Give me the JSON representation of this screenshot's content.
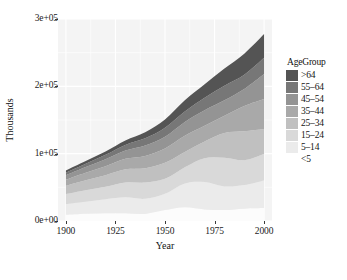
{
  "chart_data": {
    "type": "area",
    "stacked": true,
    "title": "",
    "xlabel": "Year",
    "ylabel": "Thousands",
    "xlim": [
      1896,
      2004
    ],
    "ylim": [
      0,
      300000
    ],
    "xticks": [
      1900,
      1925,
      1950,
      1975,
      2000
    ],
    "xtick_labels": [
      "1900",
      "1925",
      "1950",
      "1975",
      "2000"
    ],
    "yticks": [
      0,
      100000,
      200000,
      300000
    ],
    "ytick_labels": [
      "0e+00",
      "1e+05",
      "2e+05",
      "3e+05"
    ],
    "grid": true,
    "legend_title": "AgeGroup",
    "legend_position": "right",
    "panel_background": "#f4f4f4",
    "gridline_color": "#ffffff",
    "x": [
      1900,
      1910,
      1920,
      1930,
      1940,
      1950,
      1960,
      1970,
      1980,
      1990,
      2000
    ],
    "series": [
      {
        "name": "<5",
        "color": "#fcfcfc",
        "values": [
          9171,
          10631,
          11573,
          11444,
          10541,
          16163,
          20321,
          17154,
          16348,
          18354,
          19176
        ]
      },
      {
        "name": "5-14",
        "color": "#ebebeb",
        "values": [
          16000,
          18000,
          20703,
          23643,
          22431,
          24319,
          35465,
          40746,
          34942,
          35095,
          41078
        ]
      },
      {
        "name": "15-24",
        "color": "#d9d9d9",
        "values": [
          14951,
          17205,
          18701,
          22224,
          24033,
          22098,
          24020,
          35441,
          42487,
          36737,
          39184
        ]
      },
      {
        "name": "25-34",
        "color": "#c0c0c0",
        "values": [
          12161,
          14725,
          17112,
          19368,
          21339,
          23759,
          22818,
          24907,
          37082,
          43176,
          37233
        ]
      },
      {
        "name": "35-44",
        "color": "#a9a9a9",
        "values": [
          9273,
          11276,
          13395,
          15597,
          18333,
          21450,
          24081,
          23088,
          25635,
          37578,
          44659
        ]
      },
      {
        "name": "45-54",
        "color": "#949494",
        "values": [
          6437,
          8310,
          10242,
          12347,
          15512,
          17343,
          20485,
          23220,
          22800,
          25224,
          37030
        ]
      },
      {
        "name": "55-64",
        "color": "#777777",
        "values": [
          4010,
          5054,
          6532,
          8397,
          10572,
          13370,
          15572,
          18590,
          21703,
          21114,
          24275
        ]
      },
      {
        "name": ">64",
        "color": "#545454",
        "values": [
          3080,
          3950,
          4933,
          6634,
          9019,
          12270,
          16560,
          20066,
          25549,
          31242,
          34992
        ]
      }
    ],
    "totals": [
      75083,
      89151,
      103191,
      119654,
      131780,
      150772,
      179322,
      203212,
      226546,
      248520,
      277627
    ],
    "legend_entries": [
      {
        "label": ">64",
        "color": "#545454"
      },
      {
        "label": "55–64",
        "color": "#777777"
      },
      {
        "label": "45–54",
        "color": "#949494"
      },
      {
        "label": "35–44",
        "color": "#a9a9a9"
      },
      {
        "label": "25–34",
        "color": "#c0c0c0"
      },
      {
        "label": "15–24",
        "color": "#d9d9d9"
      },
      {
        "label": "5–14",
        "color": "#ebebeb"
      },
      {
        "label": "<5",
        "color": "#fcfcfc"
      }
    ]
  }
}
